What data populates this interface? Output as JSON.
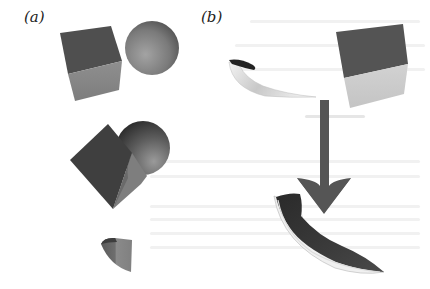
{
  "figure": {
    "panels": [
      {
        "label": "(a)",
        "objects": [
          "cube",
          "sphere",
          "cube-sphere-union",
          "intersection-wedge"
        ]
      },
      {
        "label": "(b)",
        "objects": [
          "curved-sheet",
          "cube",
          "down-arrow",
          "deformed-sheet"
        ]
      }
    ],
    "colors": {
      "background": "#ffffff",
      "cube_top": "#4d4d4d",
      "cube_side": "#8a8a8a",
      "sphere_light": "#9a9a9a",
      "sphere_dark": "#444444",
      "arrow": "#555555",
      "label": "#222222"
    }
  }
}
